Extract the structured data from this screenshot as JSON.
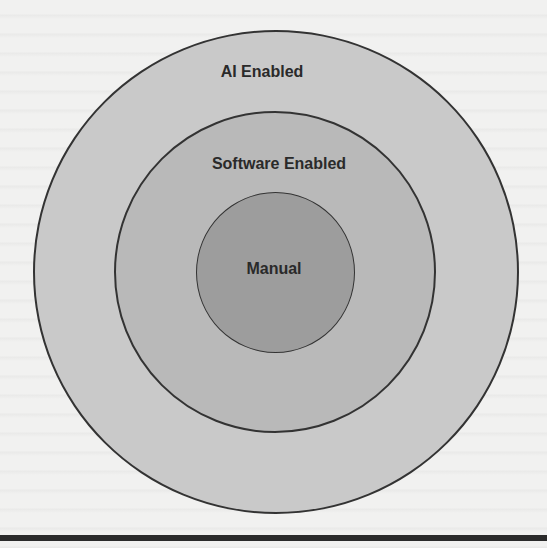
{
  "diagram": {
    "type": "concentric-circles",
    "rings": [
      {
        "label": "AI Enabled",
        "level": "outer",
        "fill": "#c9c9c9"
      },
      {
        "label": "Software Enabled",
        "level": "middle",
        "fill": "#b9b9b9"
      },
      {
        "label": "Manual",
        "level": "inner",
        "fill": "#9d9d9d"
      }
    ],
    "stroke": "#333333"
  }
}
